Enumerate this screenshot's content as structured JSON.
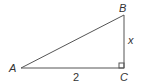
{
  "diagram": {
    "type": "right-triangle",
    "vertices": {
      "A": {
        "label": "A"
      },
      "B": {
        "label": "B"
      },
      "C": {
        "label": "C"
      }
    },
    "sides": {
      "AC": {
        "label": "2"
      },
      "BC": {
        "label": "x"
      }
    },
    "right_angle_at": "C",
    "stroke_color": "#555555"
  }
}
